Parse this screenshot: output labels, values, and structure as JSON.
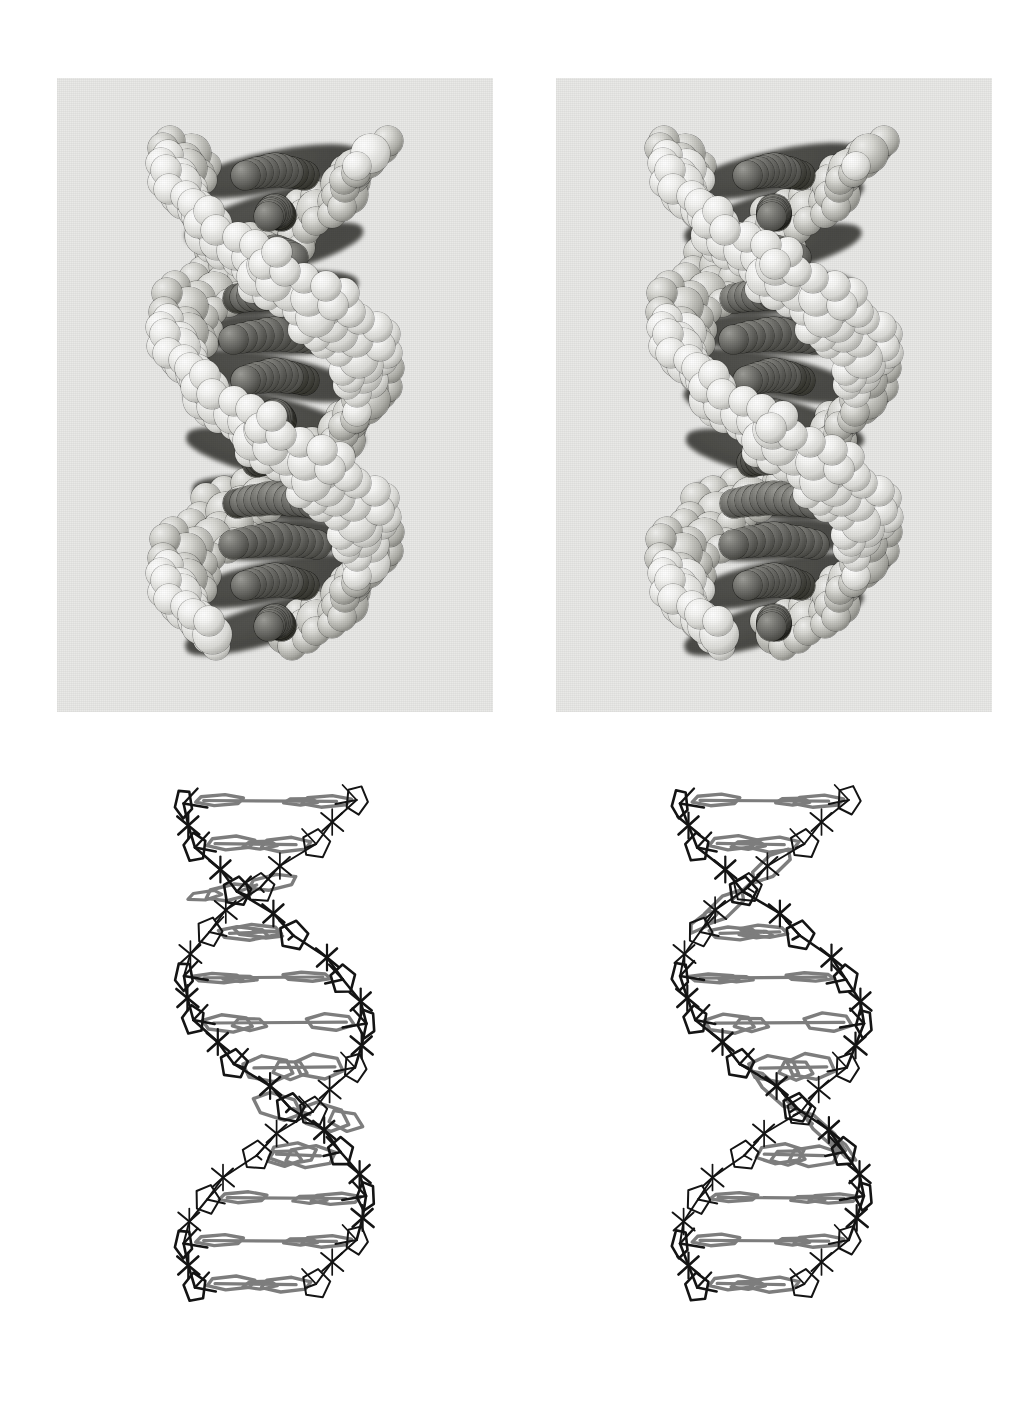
{
  "figure": {
    "kind": "stereo-pair-molecular-figure",
    "background_color": "#ffffff",
    "panel_background_color": "#e9e9e7",
    "rows": [
      {
        "row_name": "space-filling-stereo-pair",
        "representation": "space-filling (CPK) model",
        "panels": [
          {
            "panel_name": "space-filling-left-eye-view",
            "eye": "left"
          },
          {
            "panel_name": "space-filling-right-eye-view",
            "eye": "right"
          }
        ],
        "colors": {
          "backbone_atoms": "#f2f2ee",
          "base_atoms": "#4a4a45",
          "panel": "#e9e9e7"
        }
      },
      {
        "row_name": "wireframe-stereo-pair",
        "representation": "skeletal / stick (wireframe) model",
        "panels": [
          {
            "panel_name": "wireframe-left-eye-view",
            "eye": "left"
          },
          {
            "panel_name": "wireframe-right-eye-view",
            "eye": "right"
          }
        ],
        "colors": {
          "backbone_bonds": "#141414",
          "base_pair_bonds": "#7d7d7d",
          "panel": "#ffffff"
        }
      }
    ],
    "captions": {
      "figure_label": "",
      "caption_text": ""
    }
  },
  "chart_data": {
    "type": "scatter",
    "title": "",
    "xlabel": "",
    "ylabel": "",
    "note": "Molecular stereo figure — no numeric axes are drawn."
  }
}
